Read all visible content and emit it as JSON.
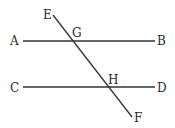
{
  "diagram": {
    "type": "parallel-lines-transversal",
    "lines": [
      {
        "id": "AB",
        "from": "A",
        "to": "B"
      },
      {
        "id": "CD",
        "from": "C",
        "to": "D"
      },
      {
        "id": "EF",
        "from": "E",
        "to": "F"
      }
    ],
    "labels": {
      "A": "A",
      "B": "B",
      "C": "C",
      "D": "D",
      "E": "E",
      "F": "F",
      "G": "G",
      "H": "H"
    },
    "stroke_color": "#333333"
  }
}
